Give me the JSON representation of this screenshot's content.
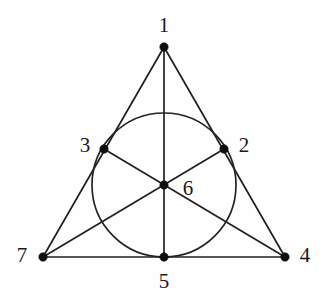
{
  "figure": {
    "kind": "fano-plane-incidence-diagram",
    "background_color": "#fefefe",
    "stroke_color": "#221f1f",
    "dot_color": "#100f0f",
    "label_color": "#1b1919"
  },
  "chart_data": {
    "type": "diagram",
    "title": "",
    "xlabel": "",
    "ylabel": "",
    "points": [
      {
        "label": "1",
        "x": 164,
        "y": 47,
        "label_x": 164,
        "label_y": 25
      },
      {
        "label": "2",
        "x": 224,
        "y": 149,
        "label_x": 244,
        "label_y": 145
      },
      {
        "label": "3",
        "x": 104,
        "y": 149,
        "label_x": 85,
        "label_y": 145
      },
      {
        "label": "4",
        "x": 285,
        "y": 257,
        "label_x": 305,
        "label_y": 255
      },
      {
        "label": "5",
        "x": 164,
        "y": 257,
        "label_x": 164,
        "label_y": 281
      },
      {
        "label": "6",
        "x": 164,
        "y": 185,
        "label_x": 188,
        "label_y": 188
      },
      {
        "label": "7",
        "x": 43,
        "y": 257,
        "label_x": 22,
        "label_y": 255
      }
    ],
    "segments": [
      {
        "name": "line-1-3-7",
        "from": "1",
        "to": "7",
        "x1": 164,
        "y1": 47,
        "x2": 43,
        "y2": 257
      },
      {
        "name": "line-1-2-4",
        "from": "1",
        "to": "4",
        "x1": 164,
        "y1": 47,
        "x2": 285,
        "y2": 257
      },
      {
        "name": "line-7-5-4",
        "from": "7",
        "to": "4",
        "x1": 43,
        "y1": 257,
        "x2": 285,
        "y2": 257
      },
      {
        "name": "line-1-6-5",
        "from": "1",
        "to": "5",
        "x1": 164,
        "y1": 47,
        "x2": 164,
        "y2": 257
      },
      {
        "name": "line-3-6-4",
        "from": "3",
        "to": "4",
        "x1": 104,
        "y1": 149,
        "x2": 285,
        "y2": 257
      },
      {
        "name": "line-2-6-7",
        "from": "2",
        "to": "7",
        "x1": 224,
        "y1": 149,
        "x2": 43,
        "y2": 257
      }
    ],
    "circle": {
      "name": "line-3-2-5",
      "cx": 164,
      "cy": 185,
      "r": 72,
      "passes_through": [
        "3",
        "2",
        "5"
      ]
    },
    "dot_radius": 4.2,
    "line_width": 1.7
  }
}
